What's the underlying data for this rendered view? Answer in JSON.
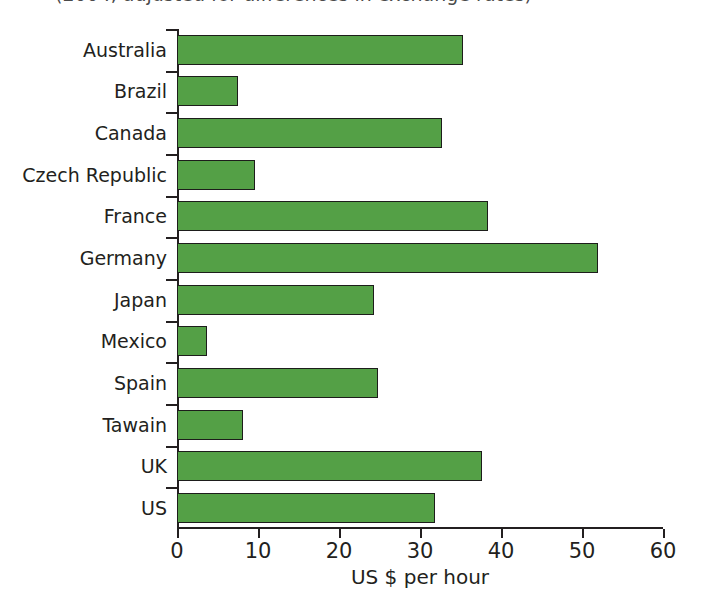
{
  "chart_data": {
    "type": "bar",
    "orientation": "horizontal",
    "title": "(2004, adjusted for differences in exchange rates)",
    "xlabel": "US $ per hour",
    "ylabel": "",
    "xlim": [
      0,
      60
    ],
    "xticks": [
      0,
      10,
      20,
      30,
      40,
      50,
      60
    ],
    "grid": false,
    "legend": null,
    "bar_color": "#54a046",
    "bar_edge_color": "#1d1d1b",
    "categories": [
      "Australia",
      "Brazil",
      "Canada",
      "Czech Republic",
      "France",
      "Germany",
      "Japan",
      "Mexico",
      "Spain",
      "Tawain",
      "UK",
      "US"
    ],
    "values": [
      35.3,
      7.5,
      32.7,
      9.6,
      38.4,
      52.0,
      24.3,
      3.7,
      24.8,
      8.2,
      37.7,
      31.9
    ]
  }
}
